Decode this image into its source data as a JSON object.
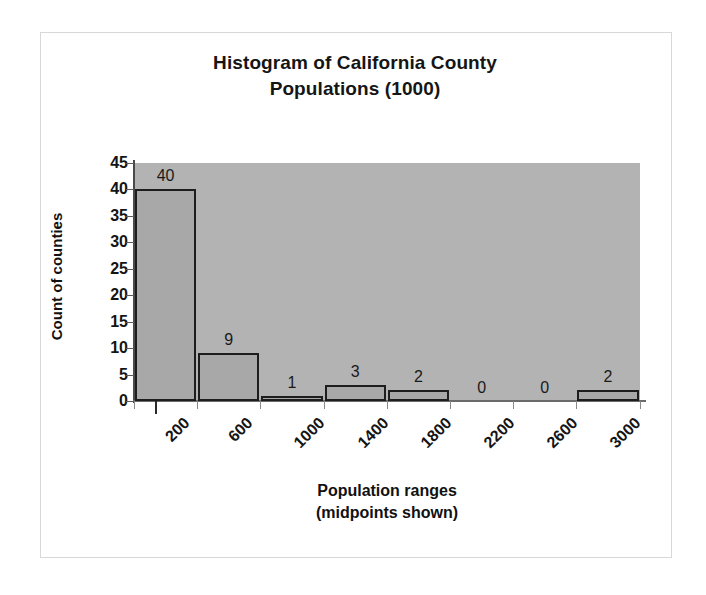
{
  "chart_data": {
    "type": "bar",
    "title": "Histogram of California County Populations (1000)",
    "title_lines": [
      "Histogram of California County",
      "Populations (1000)"
    ],
    "xlabel": "Population ranges (midpoints shown)",
    "xlabel_lines": [
      "Population ranges",
      "(midpoints shown)"
    ],
    "ylabel": "Count of counties",
    "categories": [
      "200",
      "600",
      "1000",
      "1400",
      "1800",
      "2200",
      "2600",
      "3000"
    ],
    "values": [
      40,
      9,
      1,
      3,
      2,
      0,
      0,
      2
    ],
    "value_labels": [
      "40",
      "9",
      "1",
      "3",
      "2",
      "0",
      "0",
      "2"
    ],
    "ylim": [
      0,
      45
    ],
    "yticks": [
      0,
      5,
      10,
      15,
      20,
      25,
      30,
      35,
      40,
      45
    ],
    "ytick_labels": [
      "0",
      "5",
      "10",
      "15",
      "20",
      "25",
      "30",
      "35",
      "40",
      "45"
    ],
    "grid": false,
    "legend": false,
    "colors": {
      "plot_background": "#b3b3b3",
      "bar_fill": "#a8a8a8",
      "bar_outline": "#1d1d1d",
      "axis": "#4a4a4a",
      "text": "#141414",
      "page_background": "#ffffff",
      "frame": "#d8d8d8"
    }
  }
}
